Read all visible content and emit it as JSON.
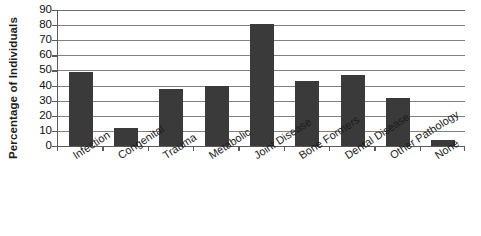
{
  "chart_data": {
    "type": "bar",
    "title": "",
    "xlabel": "",
    "ylabel": "Percentage of Individuals",
    "ylim": [
      0,
      90
    ],
    "ytick_step": 10,
    "yticks": [
      90,
      80,
      70,
      60,
      50,
      40,
      30,
      20,
      10,
      0
    ],
    "grid": true,
    "legend": "none",
    "bar_color": "#3a3a3a",
    "categories": [
      "Infection",
      "Congenital",
      "Trauma",
      "Metabolic",
      "Joint Disease",
      "Bone Formers",
      "Dental Disease",
      "Other Pathology",
      "None"
    ],
    "values": [
      49,
      12,
      38,
      40,
      81,
      43,
      47,
      32,
      4
    ]
  }
}
